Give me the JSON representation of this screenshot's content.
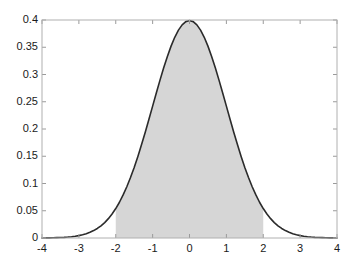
{
  "chart_data": {
    "type": "line",
    "title": "",
    "subtitle": "",
    "xlabel": "",
    "ylabel": "",
    "xlim": [
      -4,
      4
    ],
    "ylim": [
      0,
      0.4
    ],
    "grid": false,
    "legend": null,
    "xticks": [
      -4,
      -3,
      -2,
      -1,
      0,
      1,
      2,
      3,
      4
    ],
    "xticklabels": [
      "-4",
      "-3",
      "-2",
      "-1",
      "0",
      "1",
      "2",
      "3",
      "4"
    ],
    "yticks": [
      0,
      0.05,
      0.1,
      0.15,
      0.2,
      0.25,
      0.3,
      0.35,
      0.4
    ],
    "yticklabels": [
      "0",
      "0.05",
      "0.1",
      "0.15",
      "0.2",
      "0.25",
      "0.3",
      "0.35",
      "0.4"
    ],
    "series": [
      {
        "name": "standard normal pdf",
        "type": "line",
        "color": "#2b2b2b",
        "linewidth": 1.6,
        "x": [
          -4,
          -3.9,
          -3.8,
          -3.7,
          -3.6,
          -3.5,
          -3.4,
          -3.3,
          -3.2,
          -3.1,
          -3,
          -2.9,
          -2.8,
          -2.7,
          -2.6,
          -2.5,
          -2.4,
          -2.3,
          -2.2,
          -2.1,
          -2,
          -1.9,
          -1.8,
          -1.7,
          -1.6,
          -1.5,
          -1.4,
          -1.3,
          -1.2,
          -1.1,
          -1,
          -0.9,
          -0.8,
          -0.7,
          -0.6,
          -0.5,
          -0.4,
          -0.3,
          -0.2,
          -0.1,
          0,
          0.1,
          0.2,
          0.3,
          0.4,
          0.5,
          0.6,
          0.7,
          0.8,
          0.9,
          1,
          1.1,
          1.2,
          1.3,
          1.4,
          1.5,
          1.6,
          1.7,
          1.8,
          1.9,
          2,
          2.1,
          2.2,
          2.3,
          2.4,
          2.5,
          2.6,
          2.7,
          2.8,
          2.9,
          3,
          3.1,
          3.2,
          3.3,
          3.4,
          3.5,
          3.6,
          3.7,
          3.8,
          3.9,
          4
        ],
        "y": [
          0.0001,
          0.0002,
          0.0003,
          0.0004,
          0.0006,
          0.0009,
          0.0012,
          0.0017,
          0.0024,
          0.0033,
          0.0044,
          0.006,
          0.0079,
          0.0104,
          0.0136,
          0.0175,
          0.0224,
          0.0283,
          0.0355,
          0.044,
          0.054,
          0.0656,
          0.079,
          0.094,
          0.1109,
          0.1295,
          0.1497,
          0.1714,
          0.1942,
          0.2179,
          0.242,
          0.2661,
          0.2897,
          0.3123,
          0.3332,
          0.3521,
          0.3683,
          0.3814,
          0.391,
          0.397,
          0.3989,
          0.397,
          0.391,
          0.3814,
          0.3683,
          0.3521,
          0.3332,
          0.3123,
          0.2897,
          0.2661,
          0.242,
          0.2179,
          0.1942,
          0.1714,
          0.1497,
          0.1295,
          0.1109,
          0.094,
          0.079,
          0.0656,
          0.054,
          0.044,
          0.0355,
          0.0283,
          0.0224,
          0.0175,
          0.0136,
          0.0104,
          0.0079,
          0.006,
          0.0044,
          0.0033,
          0.0024,
          0.0017,
          0.0012,
          0.0009,
          0.0006,
          0.0004,
          0.0003,
          0.0002,
          0.0001
        ]
      }
    ],
    "shaded_region": {
      "name": "area-under-curve",
      "x_start": -2,
      "x_end": 2,
      "fill_color": "#d6d6d6",
      "description": "shaded area under the normal curve between x = -2 and x = 2"
    },
    "axes": {
      "box_color": "#b0b0b0",
      "tick_color": "#9a9a9a",
      "background": "#ffffff"
    }
  }
}
